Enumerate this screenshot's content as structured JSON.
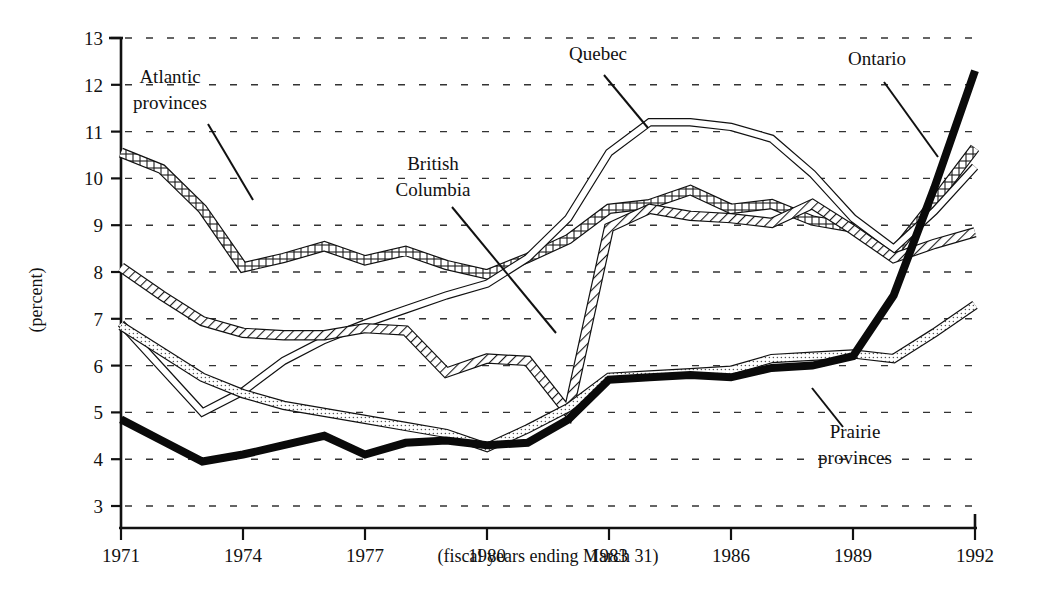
{
  "chart_data": {
    "type": "line",
    "title": "",
    "xlabel": "(fiscal years ending March 31)",
    "ylabel": "(percent)",
    "xlim": [
      1971,
      1992
    ],
    "ylim": [
      3,
      13
    ],
    "grid": true,
    "grid_style": "horizontal dashed",
    "legend_position": "inline annotations with leader lines",
    "x_ticks": [
      "1971",
      "1974",
      "1977",
      "1980",
      "1983",
      "1986",
      "1989",
      "1992"
    ],
    "x_tick_values": [
      1971,
      1974,
      1977,
      1980,
      1983,
      1986,
      1989,
      1992
    ],
    "y_ticks": [
      "3",
      "4",
      "5",
      "6",
      "7",
      "8",
      "9",
      "10",
      "11",
      "12",
      "13"
    ],
    "y_tick_values": [
      3,
      4,
      5,
      6,
      7,
      8,
      9,
      10,
      11,
      12,
      13
    ],
    "x": [
      1971,
      1972,
      1973,
      1974,
      1975,
      1976,
      1977,
      1978,
      1979,
      1980,
      1981,
      1982,
      1983,
      1984,
      1985,
      1986,
      1987,
      1988,
      1989,
      1990,
      1991,
      1992
    ],
    "series": [
      {
        "name": "Atlantic provinces",
        "style": "square-hatched band",
        "values": [
          10.55,
          10.2,
          9.35,
          8.1,
          8.3,
          8.55,
          8.25,
          8.45,
          8.15,
          7.95,
          8.3,
          8.7,
          9.35,
          9.45,
          9.75,
          9.35,
          9.45,
          9.1,
          8.95,
          8.4,
          9.5,
          10.65
        ]
      },
      {
        "name": "Quebec",
        "style": "thin double line",
        "values": [
          6.9,
          5.95,
          5.0,
          5.45,
          6.1,
          6.55,
          6.9,
          7.2,
          7.5,
          7.75,
          8.3,
          9.15,
          10.55,
          11.2,
          11.2,
          11.1,
          10.85,
          10.1,
          9.15,
          8.5,
          9.3,
          10.25
        ]
      },
      {
        "name": "British Columbia",
        "style": "diagonal-hatched band",
        "values": [
          8.1,
          7.5,
          6.95,
          6.7,
          6.65,
          6.65,
          6.8,
          6.75,
          5.85,
          6.15,
          6.1,
          5.0,
          8.95,
          9.35,
          9.2,
          9.15,
          9.05,
          9.45,
          8.9,
          8.3,
          8.6,
          8.85
        ]
      },
      {
        "name": "Prairie provinces",
        "style": "light-dotted band",
        "values": [
          6.85,
          6.3,
          5.75,
          5.4,
          5.15,
          5.0,
          4.85,
          4.7,
          4.55,
          4.25,
          4.65,
          5.1,
          5.75,
          5.8,
          5.85,
          5.9,
          6.15,
          6.2,
          6.25,
          6.15,
          6.7,
          7.3
        ]
      },
      {
        "name": "Ontario",
        "style": "thick solid black",
        "values": [
          4.85,
          4.4,
          3.95,
          4.1,
          4.3,
          4.5,
          4.1,
          4.35,
          4.4,
          4.3,
          4.35,
          4.85,
          5.7,
          5.75,
          5.8,
          5.75,
          5.95,
          6.0,
          6.2,
          7.5,
          9.8,
          12.3
        ]
      }
    ],
    "annotations": [
      {
        "text": "Atlantic provinces",
        "lines": [
          "Atlantic",
          "provinces"
        ],
        "label_x": 170,
        "label_y": 83,
        "leader_from": [
          208,
          124
        ],
        "leader_to": [
          253,
          200
        ]
      },
      {
        "text": "Quebec",
        "lines": [
          "Quebec"
        ],
        "label_x": 598,
        "label_y": 60,
        "leader_from": [
          604,
          75
        ],
        "leader_to": [
          648,
          128
        ]
      },
      {
        "text": "Ontario",
        "lines": [
          "Ontario"
        ],
        "label_x": 877,
        "label_y": 65,
        "leader_from": [
          884,
          82
        ],
        "leader_to": [
          938,
          157
        ]
      },
      {
        "text": "British Columbia",
        "lines": [
          "British",
          "Columbia"
        ],
        "label_x": 433,
        "label_y": 170,
        "leader_from": [
          452,
          207
        ],
        "leader_to": [
          556,
          333
        ]
      },
      {
        "text": "Prairie provinces",
        "lines": [
          "Prairie",
          "provinces"
        ],
        "label_x": 855,
        "label_y": 438,
        "leader_from": [
          843,
          427
        ],
        "leader_to": [
          812,
          388
        ]
      }
    ]
  },
  "axes": {
    "y_axis_title": "(percent)",
    "x_axis_title": "(fiscal years ending March 31)"
  }
}
